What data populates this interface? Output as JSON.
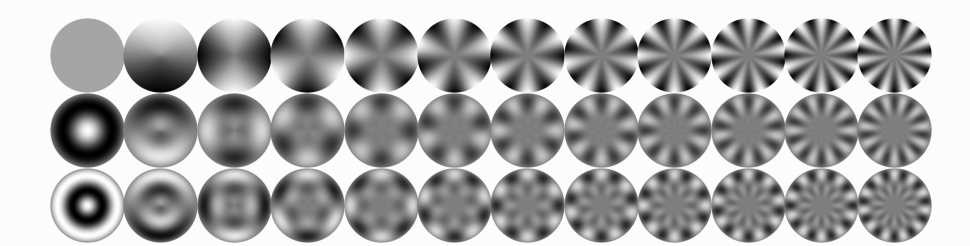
{
  "figure": {
    "background_color": "#fefefe",
    "colormap": "grayscale",
    "color_low": "#000000",
    "color_high": "#ffffff",
    "color_mid": "#808080"
  },
  "chart_data": {
    "type": "heatmap",
    "subtitle": "",
    "xlabel": "azimuthal order m",
    "ylabel": "radial order n",
    "grid": false,
    "legend": "none",
    "n_rows": 3,
    "n_cols": 12,
    "row_labels": [
      "n = 0",
      "n = 1",
      "n = 2"
    ],
    "col_labels": [
      "m = 0",
      "m = 1",
      "m = 2",
      "m = 3",
      "m = 4",
      "m = 5",
      "m = 6",
      "m = 7",
      "m = 8",
      "m = 9",
      "m = 10",
      "m = 11"
    ],
    "radial_orders": [
      0,
      1,
      2
    ],
    "azimuthal_orders": [
      0,
      1,
      2,
      3,
      4,
      5,
      6,
      7,
      8,
      9,
      10,
      11
    ],
    "value_range": [
      -1,
      1
    ],
    "cells": [
      {
        "row": 0,
        "col": 0,
        "radial": 0,
        "azimuthal": 0,
        "lobes": 0,
        "rings": 0
      },
      {
        "row": 0,
        "col": 1,
        "radial": 0,
        "azimuthal": 1,
        "lobes": 2,
        "rings": 0
      },
      {
        "row": 0,
        "col": 2,
        "radial": 0,
        "azimuthal": 2,
        "lobes": 4,
        "rings": 0
      },
      {
        "row": 0,
        "col": 3,
        "radial": 0,
        "azimuthal": 3,
        "lobes": 6,
        "rings": 0
      },
      {
        "row": 0,
        "col": 4,
        "radial": 0,
        "azimuthal": 4,
        "lobes": 8,
        "rings": 0
      },
      {
        "row": 0,
        "col": 5,
        "radial": 0,
        "azimuthal": 5,
        "lobes": 10,
        "rings": 0
      },
      {
        "row": 0,
        "col": 6,
        "radial": 0,
        "azimuthal": 6,
        "lobes": 12,
        "rings": 0
      },
      {
        "row": 0,
        "col": 7,
        "radial": 0,
        "azimuthal": 7,
        "lobes": 14,
        "rings": 0
      },
      {
        "row": 0,
        "col": 8,
        "radial": 0,
        "azimuthal": 8,
        "lobes": 16,
        "rings": 0
      },
      {
        "row": 0,
        "col": 9,
        "radial": 0,
        "azimuthal": 9,
        "lobes": 18,
        "rings": 0
      },
      {
        "row": 0,
        "col": 10,
        "radial": 0,
        "azimuthal": 10,
        "lobes": 20,
        "rings": 0
      },
      {
        "row": 0,
        "col": 11,
        "radial": 0,
        "azimuthal": 11,
        "lobes": 22,
        "rings": 0
      },
      {
        "row": 1,
        "col": 0,
        "radial": 1,
        "azimuthal": 0,
        "lobes": 0,
        "rings": 1
      },
      {
        "row": 1,
        "col": 1,
        "radial": 1,
        "azimuthal": 1,
        "lobes": 2,
        "rings": 1
      },
      {
        "row": 1,
        "col": 2,
        "radial": 1,
        "azimuthal": 2,
        "lobes": 4,
        "rings": 1
      },
      {
        "row": 1,
        "col": 3,
        "radial": 1,
        "azimuthal": 3,
        "lobes": 6,
        "rings": 1
      },
      {
        "row": 1,
        "col": 4,
        "radial": 1,
        "azimuthal": 4,
        "lobes": 8,
        "rings": 1
      },
      {
        "row": 1,
        "col": 5,
        "radial": 1,
        "azimuthal": 5,
        "lobes": 10,
        "rings": 1
      },
      {
        "row": 1,
        "col": 6,
        "radial": 1,
        "azimuthal": 6,
        "lobes": 12,
        "rings": 1
      },
      {
        "row": 1,
        "col": 7,
        "radial": 1,
        "azimuthal": 7,
        "lobes": 14,
        "rings": 1
      },
      {
        "row": 1,
        "col": 8,
        "radial": 1,
        "azimuthal": 8,
        "lobes": 16,
        "rings": 1
      },
      {
        "row": 1,
        "col": 9,
        "radial": 1,
        "azimuthal": 9,
        "lobes": 18,
        "rings": 1
      },
      {
        "row": 1,
        "col": 10,
        "radial": 1,
        "azimuthal": 10,
        "lobes": 20,
        "rings": 1
      },
      {
        "row": 1,
        "col": 11,
        "radial": 1,
        "azimuthal": 11,
        "lobes": 22,
        "rings": 1
      },
      {
        "row": 2,
        "col": 0,
        "radial": 2,
        "azimuthal": 0,
        "lobes": 0,
        "rings": 2
      },
      {
        "row": 2,
        "col": 1,
        "radial": 2,
        "azimuthal": 1,
        "lobes": 2,
        "rings": 2
      },
      {
        "row": 2,
        "col": 2,
        "radial": 2,
        "azimuthal": 2,
        "lobes": 4,
        "rings": 2
      },
      {
        "row": 2,
        "col": 3,
        "radial": 2,
        "azimuthal": 3,
        "lobes": 6,
        "rings": 2
      },
      {
        "row": 2,
        "col": 4,
        "radial": 2,
        "azimuthal": 4,
        "lobes": 8,
        "rings": 2
      },
      {
        "row": 2,
        "col": 5,
        "radial": 2,
        "azimuthal": 5,
        "lobes": 10,
        "rings": 2
      },
      {
        "row": 2,
        "col": 6,
        "radial": 2,
        "azimuthal": 6,
        "lobes": 12,
        "rings": 2
      },
      {
        "row": 2,
        "col": 7,
        "radial": 2,
        "azimuthal": 7,
        "lobes": 14,
        "rings": 2
      },
      {
        "row": 2,
        "col": 8,
        "radial": 2,
        "azimuthal": 8,
        "lobes": 16,
        "rings": 2
      },
      {
        "row": 2,
        "col": 9,
        "radial": 2,
        "azimuthal": 9,
        "lobes": 18,
        "rings": 2
      },
      {
        "row": 2,
        "col": 10,
        "radial": 2,
        "azimuthal": 10,
        "lobes": 20,
        "rings": 2
      },
      {
        "row": 2,
        "col": 11,
        "radial": 2,
        "azimuthal": 11,
        "lobes": 22,
        "rings": 2
      }
    ]
  },
  "layout": {
    "origin_x": 50,
    "origin_y": 18,
    "cell_pitch_x": 73.4,
    "cell_pitch_y": 74.8,
    "disk_diameter": 75
  }
}
